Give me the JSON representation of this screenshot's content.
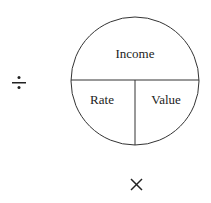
{
  "diagram": {
    "top_label": "Income",
    "bottom_left_label": "Rate",
    "bottom_right_label": "Value",
    "divide_symbol": "÷",
    "multiply_symbol": "×",
    "stroke_color": "#333333"
  }
}
